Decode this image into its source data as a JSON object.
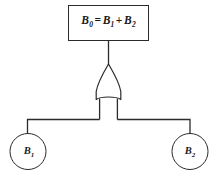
{
  "diagram": {
    "type": "fault-tree-or-gate",
    "background_color": "#ffffff",
    "stroke_color": "#2b2b2b",
    "text_color": "#1a1a1a",
    "formula_box": {
      "name": "B0-formula-box",
      "expression": "B0 = B1 + B2",
      "lhs": "B",
      "lhs_sub": "0",
      "equals": "=",
      "rhs_first": "B",
      "rhs_first_sub": "1",
      "plus": "+",
      "rhs_second": "B",
      "rhs_second_sub": "2"
    },
    "gate": {
      "name": "or-gate",
      "kind": "OR",
      "inputs": 2,
      "outputs": 1
    },
    "nodes": [
      {
        "id": "B1",
        "shape": "circle",
        "letter": "B",
        "subscript": "1"
      },
      {
        "id": "B2",
        "shape": "circle",
        "letter": "B",
        "subscript": "2"
      }
    ],
    "connections": [
      {
        "from": "B0-formula-box",
        "to": "or-gate"
      },
      {
        "from": "or-gate",
        "to": "B1"
      },
      {
        "from": "or-gate",
        "to": "B2"
      }
    ]
  }
}
